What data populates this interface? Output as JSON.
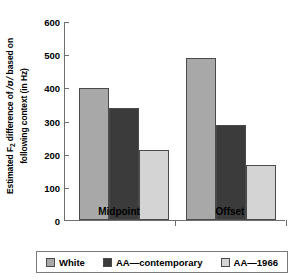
{
  "chart_data": {
    "type": "bar",
    "title": "",
    "xlabel": "",
    "ylabel_line1": "Estimated F2 difference of /ʊ/ based on",
    "ylabel_line2": "following context (in Hz)",
    "categories": [
      "Midpoint",
      "Offset"
    ],
    "series": [
      {
        "name": "White",
        "values": [
          398,
          490
        ],
        "color": "#a8a8a8"
      },
      {
        "name": "AA—contemporary",
        "values": [
          338,
          288
        ],
        "color": "#3b3b3b"
      },
      {
        "name": "AA—1966",
        "values": [
          212,
          165
        ],
        "color": "#d4d4d4"
      }
    ],
    "ylim": [
      0,
      600
    ],
    "yticks": [
      0,
      100,
      200,
      300,
      400,
      500,
      600
    ],
    "ytick_labels": [
      "0",
      "100",
      "200",
      "300",
      "400",
      "500",
      "600"
    ],
    "grid": false,
    "legend_position": "bottom"
  },
  "axis": {
    "y_title_prefix": "Estimated F",
    "y_title_subscript": "2",
    "y_title_mid": " difference of ",
    "y_title_ipa": "/ʊ/",
    "y_title_suffix": " based on",
    "y_title_line2": "following context (in Hz)"
  },
  "ticks": {
    "t600": "600",
    "t500": "500",
    "t400": "400",
    "t300": "300",
    "t200": "200",
    "t100": "100",
    "t0": "0"
  },
  "categories": {
    "midpoint": "Midpoint",
    "offset": "Offset"
  },
  "legend": {
    "white": "White",
    "contemporary": "AA—contemporary",
    "aa1966": "AA—1966"
  }
}
